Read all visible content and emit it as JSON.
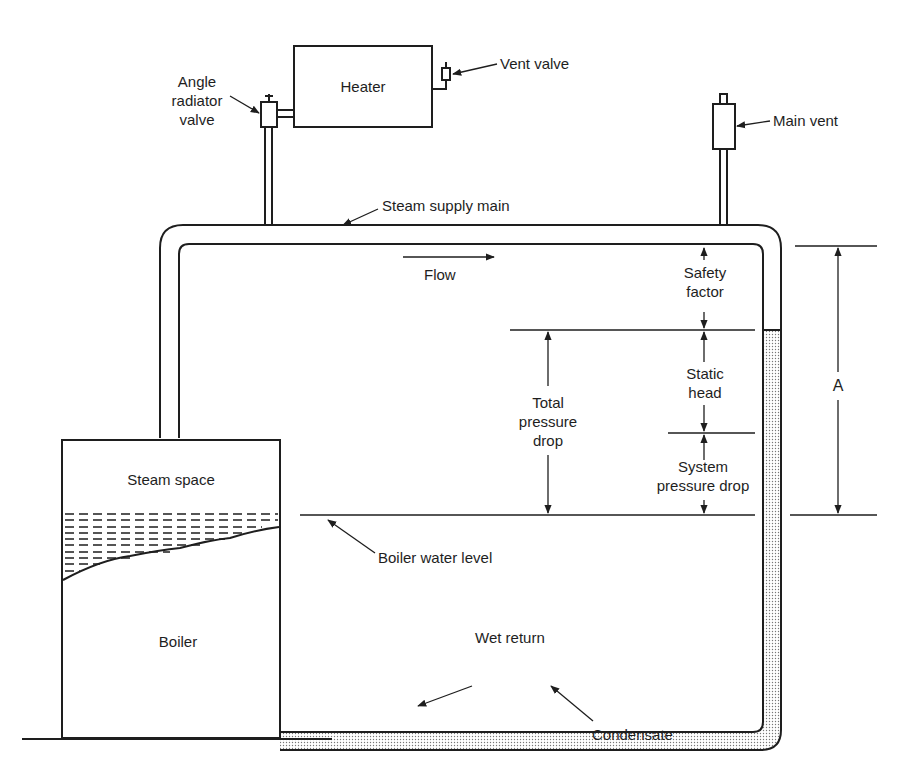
{
  "diagram": {
    "type": "one-pipe steam heating system schematic",
    "labels": {
      "heater": "Heater",
      "vent_valve": "Vent valve",
      "angle_radiator_valve": [
        "Angle",
        "radiator",
        "valve"
      ],
      "main_vent": "Main vent",
      "steam_supply_main": "Steam supply main",
      "flow": "Flow",
      "safety_factor": [
        "Safety",
        "factor"
      ],
      "static_head": [
        "Static",
        "head"
      ],
      "system_pressure_drop": [
        "System",
        "pressure drop"
      ],
      "total_pressure_drop": [
        "Total",
        "pressure",
        "drop"
      ],
      "dimension_a": "A",
      "steam_space": "Steam space",
      "boiler": "Boiler",
      "boiler_water_level": "Boiler water level",
      "wet_return": "Wet return",
      "condensate": "Condensate"
    },
    "colors": {
      "line": "#1e1e1e",
      "condensate_fill": "#d9d9d9",
      "background": "#ffffff"
    }
  }
}
